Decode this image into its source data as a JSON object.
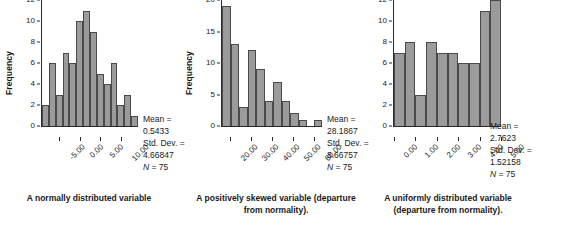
{
  "figure": {
    "panels": [
      {
        "id": "normal",
        "caption": "A normally distributed variable",
        "ylabel": "Frequency",
        "stats": {
          "mean_label": "Mean =",
          "mean_value": "0.5433",
          "sd_label": "Std. Dev. =",
          "sd_value": "4.66847",
          "n_label": "N",
          "n_value": "= 75"
        }
      },
      {
        "id": "skewed",
        "caption": "A positively skewed variable (departure from normality).",
        "ylabel": "Frequency",
        "stats": {
          "mean_label": "Mean =",
          "mean_value": "28.1867",
          "sd_label": "Std. Dev. =",
          "sd_value": "8.66757",
          "n_label": "N",
          "n_value": "= 75"
        }
      },
      {
        "id": "uniform",
        "caption": "A uniformly distributed variable (departure from normality).",
        "ylabel": "",
        "stats": {
          "mean_label": "Mean =",
          "mean_value": "2.7623",
          "sd_label": "Std. Dev. =",
          "sd_value": "1.52158",
          "n_label": "N",
          "n_value": "= 75"
        }
      }
    ]
  },
  "chart_data": [
    {
      "type": "bar",
      "title": "A normally distributed variable",
      "xlabel": "",
      "ylabel": "Frequency",
      "ylim": [
        0,
        12
      ],
      "yticks": [
        0,
        2,
        4,
        6,
        8,
        10,
        12
      ],
      "xticks": [
        "-5.00",
        "0.00",
        "5.00",
        "10.00"
      ],
      "xtick_positions": [
        0.1786,
        0.3929,
        0.6071,
        0.8214
      ],
      "grid": false,
      "legend": null,
      "categories": [
        "b1",
        "b2",
        "b3",
        "b4",
        "b5",
        "b6",
        "b7",
        "b8",
        "b9",
        "b10",
        "b11",
        "b12",
        "b13",
        "b14"
      ],
      "values": [
        2,
        6,
        3,
        7,
        6,
        10,
        11,
        9,
        5,
        4,
        6,
        2,
        3,
        1
      ],
      "annotation": "Mean = 0.5433; Std. Dev. = 4.66847; N = 75"
    },
    {
      "type": "bar",
      "title": "A positively skewed variable (departure from normality).",
      "xlabel": "",
      "ylabel": "Frequency",
      "ylim": [
        0,
        20
      ],
      "yticks": [
        0,
        5,
        10,
        15,
        20
      ],
      "xticks": [
        "20.00",
        "30.00",
        "40.00",
        "50.00",
        "60.00"
      ],
      "xtick_positions": [
        0.0833,
        0.2917,
        0.5,
        0.7083,
        0.9167
      ],
      "grid": false,
      "legend": null,
      "categories": [
        "b1",
        "b2",
        "b3",
        "b4",
        "b5",
        "b6",
        "b7",
        "b8",
        "b9",
        "b10",
        "b11",
        "b12"
      ],
      "values": [
        19,
        13,
        3,
        12,
        9,
        4,
        7,
        4,
        2,
        1,
        0,
        1
      ],
      "annotation": "Mean = 28.1867; Std. Dev. = 8.66757; N = 75"
    },
    {
      "type": "bar",
      "title": "A uniformly distributed variable (departure from normality).",
      "xlabel": "",
      "ylabel": "",
      "ylim": [
        0,
        12
      ],
      "yticks": [
        0,
        2,
        4,
        6,
        8,
        10,
        12
      ],
      "xticks": [
        "0.00",
        "1.00",
        "2.00",
        "3.00",
        "4.00",
        "5.00"
      ],
      "xtick_positions": [
        0.0,
        0.2,
        0.4,
        0.6,
        0.8,
        1.0
      ],
      "grid": false,
      "legend": null,
      "categories": [
        "b1",
        "b2",
        "b3",
        "b4",
        "b5",
        "b6",
        "b7",
        "b8",
        "b9",
        "b10"
      ],
      "values": [
        7,
        8,
        3,
        8,
        7,
        7,
        6,
        6,
        11,
        12
      ],
      "annotation": "Mean = 2.7623; Std. Dev. = 1.52158; N = 75"
    }
  ]
}
